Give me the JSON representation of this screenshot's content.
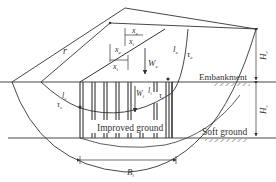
{
  "diagram": {
    "type": "slope-stability-cross-section",
    "layers": {
      "embankment_label": "Embankment",
      "improved_label": "Improved ground",
      "soft_label": "Soft ground"
    },
    "symbols": {
      "radius": "r",
      "xe_top": "x",
      "xe_top_sub": "e",
      "xi_top": "x",
      "xi_top_sub": "i",
      "xe_mid": "x",
      "xe_mid_sub": "e",
      "xi_mid": "x",
      "xi_mid_sub": "i",
      "We": "W",
      "We_sub": "e",
      "Wi": "W",
      "Wi_sub": "i",
      "le": "l",
      "le_sub": "e",
      "tau_e": "τ",
      "tau_e_sub": "e",
      "li": "l",
      "li_sub": "i",
      "tau_i": "τ",
      "tau_i_sub": "i",
      "lc": "l",
      "lc_sub": "c",
      "tau_c": "τ",
      "tau_c_sub": "c",
      "He": "H",
      "He_sub": "e",
      "Hc": "H",
      "Hc_sub": "c",
      "Bi": "B",
      "Bi_sub": "i"
    },
    "colors": {
      "line": "#333333",
      "background": "#ffffff"
    }
  }
}
